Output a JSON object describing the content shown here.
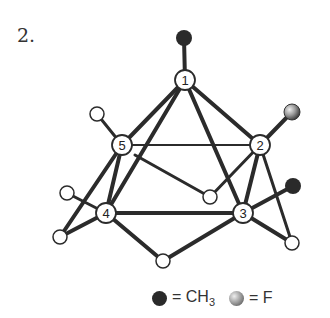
{
  "figure": {
    "label": "2."
  },
  "nodes": [
    {
      "id": "1",
      "label": "1",
      "x": 185,
      "y": 80
    },
    {
      "id": "2",
      "label": "2",
      "x": 260,
      "y": 145
    },
    {
      "id": "3",
      "label": "3",
      "x": 243,
      "y": 213
    },
    {
      "id": "4",
      "label": "4",
      "x": 106,
      "y": 213
    },
    {
      "id": "5",
      "label": "5",
      "x": 122,
      "y": 145
    }
  ],
  "substituents": [
    {
      "type": "CH3",
      "x": 184,
      "y": 38,
      "bonded_to": "1"
    },
    {
      "type": "F",
      "x": 292,
      "y": 112,
      "bonded_to": "2"
    },
    {
      "type": "CH3",
      "x": 293,
      "y": 186,
      "bonded_to": "3"
    },
    {
      "type": "H",
      "x": 97,
      "y": 114,
      "bonded_to": "5"
    },
    {
      "type": "H",
      "x": 67,
      "y": 193,
      "bonded_to": "4"
    },
    {
      "type": "H",
      "x": 60,
      "y": 237,
      "bonded_to": "4"
    },
    {
      "type": "H",
      "x": 210,
      "y": 197,
      "bonded_to": "2"
    },
    {
      "type": "H",
      "x": 163,
      "y": 261,
      "bonded_to": "4"
    },
    {
      "type": "H",
      "x": 292,
      "y": 243,
      "bonded_to": "3"
    }
  ],
  "legend": {
    "ch3_eq": "= CH",
    "ch3_sub": "3",
    "f_eq": "= F"
  }
}
